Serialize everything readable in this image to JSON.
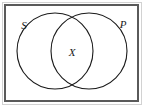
{
  "figure": {
    "kind": "venn-diagram",
    "background_color": "#ffffff",
    "frame": {
      "name": "universal-set-rectangle",
      "outer_line_color": "#c9c9c9",
      "border_color": "#5a5a5a",
      "fill_color": "#ffffff",
      "x": 5,
      "y": 5,
      "width": 133,
      "height": 96,
      "stroke_width": 2
    },
    "circles": [
      {
        "name": "set-s-circle",
        "label": "S",
        "cx": 55,
        "cy": 51,
        "r": 38,
        "stroke_color": "#1a1a1a",
        "fill_color": "none",
        "stroke_width": 1.1
      },
      {
        "name": "set-p-circle",
        "label": "P",
        "cx": 89,
        "cy": 51,
        "r": 38,
        "stroke_color": "#1a1a1a",
        "fill_color": "none",
        "stroke_width": 1.1
      }
    ],
    "labels": [
      {
        "name": "set-s-label",
        "text": "S",
        "x": 24,
        "y": 29,
        "font_size": 11,
        "color": "#1a1a1a"
      },
      {
        "name": "set-p-label",
        "text": "P",
        "x": 123,
        "y": 28,
        "font_size": 11,
        "color": "#1a1a1a"
      },
      {
        "name": "intersection-label",
        "text": "X",
        "x": 72,
        "y": 56,
        "font_size": 11,
        "color": "#1a1a1a"
      }
    ]
  }
}
